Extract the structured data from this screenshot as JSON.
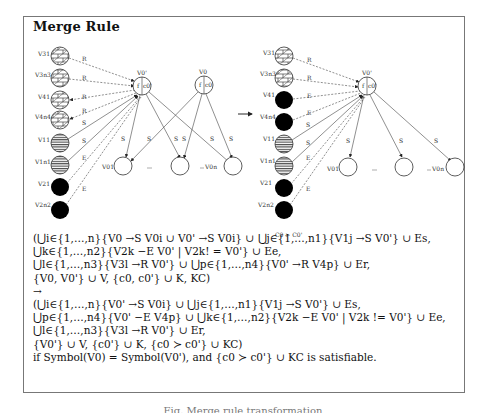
{
  "title": "Merge Rule",
  "constraint_label": "C0 > C0'",
  "left_diagram": {
    "children": [
      {
        "label": "V31",
        "fill": "brick"
      },
      {
        "label": "V3n3",
        "fill": "brick"
      },
      {
        "label": "V41",
        "fill": "brick"
      },
      {
        "label": "V4n4",
        "fill": "brick"
      },
      {
        "label": "V11",
        "fill": "stripes"
      },
      {
        "label": "V1n1",
        "fill": "stripes"
      },
      {
        "label": "V21",
        "fill": "black"
      },
      {
        "label": "V2n2",
        "fill": "black"
      }
    ],
    "edge_labels": [
      "R",
      "R",
      "R",
      "R",
      "S",
      "S",
      "E",
      "E"
    ],
    "parents": [
      {
        "label": "V0'",
        "inner_left": "f",
        "inner_right": "c0'"
      },
      {
        "label": "V0",
        "inner_left": "f",
        "inner_right": "c0"
      }
    ],
    "targets": [
      {
        "label": "V01"
      },
      {
        "label": "..."
      },
      {
        "label": "V0n"
      }
    ],
    "target_edge_labels": [
      "S",
      "S",
      "S",
      "S",
      "S",
      "S"
    ],
    "ellipsis": "..."
  },
  "right_diagram": {
    "children": [
      {
        "label": "V31",
        "fill": "brick"
      },
      {
        "label": "V3n3",
        "fill": "brick"
      },
      {
        "label": "V41",
        "fill": "black"
      },
      {
        "label": "V4n4",
        "fill": "black"
      },
      {
        "label": "V11",
        "fill": "stripes"
      },
      {
        "label": "V1n1",
        "fill": "stripes"
      },
      {
        "label": "V21",
        "fill": "black"
      },
      {
        "label": "V2n2",
        "fill": "black"
      }
    ],
    "edge_labels": [
      "R",
      "R",
      "E",
      "E",
      "S",
      "S",
      "E",
      "E"
    ],
    "parent": {
      "label": "V0'",
      "inner_left": "f",
      "inner_right": "c0'"
    },
    "targets": [
      {
        "label": "V01"
      },
      {
        "label": "..."
      },
      {
        "label": "V0n"
      }
    ],
    "target_edge_labels": [
      "S",
      "S",
      "S"
    ],
    "ellipsis": "..."
  },
  "formula": {
    "lhs": [
      "(⋃i∈{1,…,n}{V0 →S V0i ∪ V0' →S V0i} ∪ ⋃j∈{1,…,n1}{V1j →S V0'} ∪ Es,",
      "⋃k∈{1,…,n2}{V2k −E V0' | V2k! = V0'} ∪ Ee,",
      "⋃l∈{1,…,n3}{V3l →R V0'} ∪ ⋃p∈{1,…,n4}{V0' →R V4p} ∪ Er,",
      "{V0, V0'} ∪ V, {c0, c0'} ∪ K, KC)"
    ],
    "arrow": "→",
    "rhs": [
      "(⋃i∈{1,…,n}{V0' →S V0i} ∪ ⋃j∈{1,…,n1}{V1j →S V0'} ∪ Es,",
      "⋃p∈{1,…,n4}{V0' −E V4p} ∪ ⋃k∈{1,…,n2}{V2k −E V0' | V2k != V0'} ∪ Ee,",
      "⋃l∈{1,…,n3}{V3l →R V0'} ∪ Er,",
      "{V0'} ∪ V, {c0'} ∪ K, {c0 ≻ c0'} ∪ KC)"
    ],
    "condition": "if Symbol(V0) = Symbol(V0'), and {c0 ≻ c0'} ∪ KC is satisfiable."
  },
  "caption": "Fig. Merge rule transformation"
}
